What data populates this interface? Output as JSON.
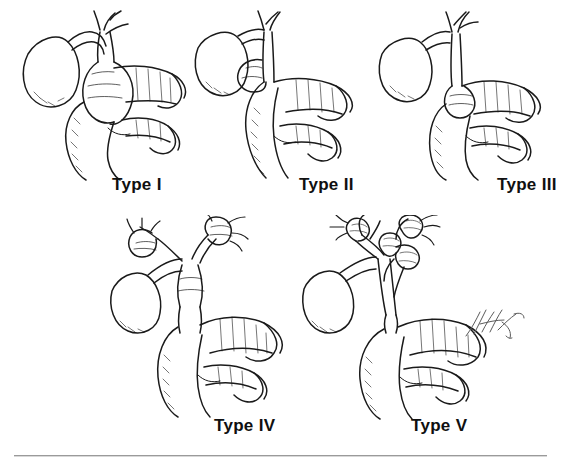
{
  "figure": {
    "background_color": "#ffffff",
    "ink_color": "#1a1a1a",
    "rule_color": "#9a9a9a",
    "width": 565,
    "height": 469
  },
  "panels": [
    {
      "id": "type-1",
      "label": "Type I",
      "description": "Fusiform dilation of the entire common bile duct with gallbladder, cystic duct, hepatic duct confluence and duodenum",
      "label_x": 112,
      "label_y": 175,
      "art_x": 14,
      "art_y": 8,
      "art_w": 180,
      "art_h": 175
    },
    {
      "id": "type-2",
      "label": "Type II",
      "description": "Isolated saccular diverticulum protruding from the common bile duct",
      "label_x": 299,
      "label_y": 175,
      "art_x": 190,
      "art_y": 8,
      "art_w": 180,
      "art_h": 175
    },
    {
      "id": "type-3",
      "label": "Type III",
      "description": "Choledochocele: dilation of the intraduodenal portion of the common bile duct",
      "label_x": 497,
      "label_y": 175,
      "art_x": 372,
      "art_y": 8,
      "art_w": 185,
      "art_h": 175
    },
    {
      "id": "type-4",
      "label": "Type IV",
      "description": "Multiple dilations involving both intrahepatic and extrahepatic bile ducts",
      "label_x": 214,
      "label_y": 424,
      "art_x": 108,
      "art_y": 215,
      "art_w": 200,
      "art_h": 205
    },
    {
      "id": "type-5",
      "label": "Type V",
      "description": "Caroli disease: multiple cystic dilations confined to the intrahepatic bile ducts",
      "label_x": 411,
      "label_y": 424,
      "art_x": 300,
      "art_y": 215,
      "art_w": 215,
      "art_h": 205
    }
  ],
  "signature": {
    "name": "artist-signature",
    "visible": true
  }
}
